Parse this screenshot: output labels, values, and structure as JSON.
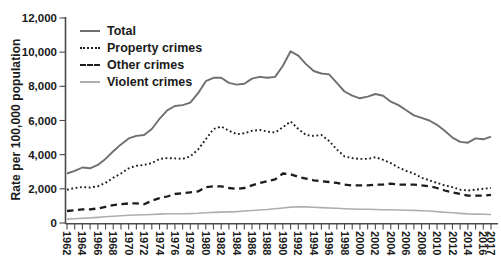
{
  "figure": {
    "y_axis": {
      "title": "Rate per 100,000 population",
      "tick_labels": [
        "0",
        "2,000",
        "4,000",
        "6,000",
        "8,000",
        "10,000",
        "12,000"
      ]
    },
    "x_axis": {
      "tick_labels": [
        "1962",
        "1964",
        "1966",
        "1968",
        "1970",
        "1972",
        "1974",
        "1976",
        "1978",
        "1980",
        "1982",
        "1984",
        "1986",
        "1988",
        "1990",
        "1992",
        "1994",
        "1996",
        "1998",
        "2000",
        "2002",
        "2004",
        "2006",
        "2008",
        "2010",
        "2012",
        "2014",
        "2016",
        "2017"
      ]
    }
  },
  "chart_data": {
    "type": "line",
    "title": "",
    "xlabel": "",
    "ylabel": "Rate per 100,000 population",
    "ylim": [
      0,
      12000
    ],
    "y_tick_step": 2000,
    "grid": false,
    "legend_position": "top-left",
    "x": [
      1962,
      1963,
      1964,
      1965,
      1966,
      1967,
      1968,
      1969,
      1970,
      1971,
      1972,
      1973,
      1974,
      1975,
      1976,
      1977,
      1978,
      1979,
      1980,
      1981,
      1982,
      1983,
      1984,
      1985,
      1986,
      1987,
      1988,
      1989,
      1990,
      1991,
      1992,
      1993,
      1994,
      1995,
      1996,
      1997,
      1998,
      1999,
      2000,
      2001,
      2002,
      2003,
      2004,
      2005,
      2006,
      2007,
      2008,
      2009,
      2010,
      2011,
      2012,
      2013,
      2014,
      2015,
      2016,
      2017
    ],
    "series": [
      {
        "name": "Total",
        "color": "#6f6f6f",
        "dash": "",
        "width": 1.9,
        "values": [
          2900,
          3050,
          3250,
          3200,
          3400,
          3750,
          4200,
          4600,
          4950,
          5100,
          5150,
          5500,
          6100,
          6600,
          6850,
          6900,
          7050,
          7600,
          8300,
          8500,
          8500,
          8200,
          8100,
          8150,
          8450,
          8550,
          8500,
          8550,
          9200,
          10050,
          9800,
          9300,
          8900,
          8750,
          8700,
          8200,
          7700,
          7450,
          7300,
          7400,
          7550,
          7450,
          7100,
          6900,
          6600,
          6300,
          6150,
          6000,
          5750,
          5400,
          5000,
          4750,
          4700,
          4950,
          4900,
          5050
        ]
      },
      {
        "name": "Property crimes",
        "color": "#1c1c1c",
        "dash": "1.8 2.6",
        "width": 1.9,
        "values": [
          1950,
          2050,
          2100,
          2080,
          2150,
          2350,
          2650,
          2900,
          3200,
          3350,
          3400,
          3500,
          3750,
          3800,
          3780,
          3750,
          3900,
          4300,
          4900,
          5500,
          5650,
          5400,
          5200,
          5250,
          5400,
          5450,
          5350,
          5300,
          5600,
          5950,
          5500,
          5150,
          5100,
          5150,
          4800,
          4300,
          3900,
          3800,
          3750,
          3750,
          3850,
          3700,
          3500,
          3250,
          3050,
          2900,
          2650,
          2500,
          2350,
          2200,
          2100,
          1950,
          1900,
          1950,
          2000,
          2050
        ]
      },
      {
        "name": "Other crimes",
        "color": "#1c1c1c",
        "dash": "6.5 4.5",
        "width": 2.3,
        "values": [
          700,
          750,
          800,
          800,
          850,
          950,
          1050,
          1100,
          1150,
          1150,
          1100,
          1300,
          1450,
          1550,
          1700,
          1750,
          1800,
          1850,
          2100,
          2150,
          2150,
          2050,
          2000,
          2050,
          2200,
          2350,
          2450,
          2550,
          2900,
          2850,
          2700,
          2600,
          2500,
          2450,
          2400,
          2350,
          2250,
          2200,
          2200,
          2200,
          2250,
          2250,
          2300,
          2250,
          2250,
          2250,
          2200,
          2150,
          2050,
          1900,
          1800,
          1700,
          1600,
          1600,
          1600,
          1650
        ]
      },
      {
        "name": "Violent crimes",
        "color": "#aeaeae",
        "dash": "",
        "width": 1.6,
        "values": [
          230,
          250,
          280,
          300,
          330,
          360,
          390,
          420,
          450,
          470,
          480,
          500,
          520,
          540,
          545,
          540,
          550,
          570,
          600,
          620,
          640,
          650,
          670,
          700,
          730,
          760,
          790,
          830,
          880,
          930,
          950,
          940,
          920,
          900,
          880,
          860,
          840,
          820,
          810,
          800,
          790,
          780,
          770,
          760,
          750,
          740,
          720,
          700,
          670,
          630,
          600,
          560,
          530,
          520,
          510,
          500
        ]
      }
    ]
  }
}
